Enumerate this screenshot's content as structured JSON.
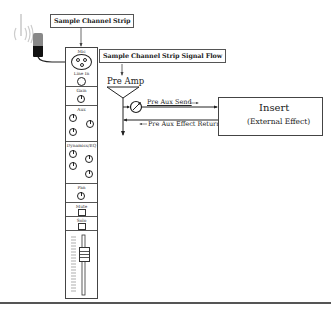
{
  "diagram": {
    "title_strip": "Sample Channel Strip",
    "title_flow": "Sample Channel Strip Signal Flow",
    "channel_strip": {
      "sections": [
        {
          "name": "mic",
          "label": "Mic"
        },
        {
          "name": "line-in",
          "label": "Line In"
        },
        {
          "name": "gain",
          "label": "Gain"
        },
        {
          "name": "aux",
          "label": "Aux"
        },
        {
          "name": "dynamics-eq",
          "label": "Dynamics/EQ"
        },
        {
          "name": "pan",
          "label": "Pan"
        },
        {
          "name": "mute",
          "label": "Mute"
        },
        {
          "name": "solo",
          "label": "Solo"
        }
      ]
    },
    "signal_flow": {
      "pre_amp": "Pre Amp",
      "pre_aux_send": "Pre Aux Send",
      "pre_aux_return": "Pre Aux Effect Return",
      "insert_title": "Insert",
      "insert_subtitle": "(External Effect)"
    },
    "colors": {
      "line": "#222222",
      "border": "#555555",
      "background": "#ffffff"
    }
  }
}
